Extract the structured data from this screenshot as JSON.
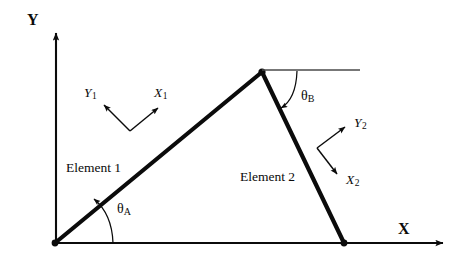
{
  "figure": {
    "background_color": "#ffffff",
    "ink_color": "#0b0b0b",
    "width": 455,
    "height": 261
  },
  "global_axes": {
    "x_label": "X",
    "y_label": "Y",
    "origin": {
      "x": 55,
      "y": 243
    },
    "x_axis_end": {
      "x": 450,
      "y": 243
    },
    "y_axis_end": {
      "x": 56,
      "y": 26
    }
  },
  "nodes": [
    {
      "name": "origin-node",
      "x": 55,
      "y": 243
    },
    {
      "name": "apex-node",
      "x": 262,
      "y": 72
    },
    {
      "name": "base-right-node",
      "x": 344,
      "y": 243
    }
  ],
  "elements": [
    {
      "label": "Element 1",
      "from": {
        "x": 55,
        "y": 243
      },
      "to": {
        "x": 262,
        "y": 72
      },
      "label_position": {
        "x": 66,
        "y": 162
      }
    },
    {
      "label": "Element 2",
      "from": {
        "x": 262,
        "y": 72
      },
      "to": {
        "x": 344,
        "y": 243
      },
      "label_position": {
        "x": 240,
        "y": 170
      }
    }
  ],
  "local_frames": [
    {
      "element": "Element 1",
      "x_axis_label": "X",
      "x_axis_subscript": "1",
      "y_axis_label": "Y",
      "y_axis_subscript": "1",
      "corner": {
        "x": 130,
        "y": 131
      },
      "x_tip": {
        "x": 162,
        "y": 104
      },
      "y_tip": {
        "x": 100,
        "y": 101
      },
      "x_label_position": {
        "x": 155,
        "y": 88
      },
      "y_label_position": {
        "x": 84,
        "y": 88
      }
    },
    {
      "element": "Element 2",
      "x_axis_label": "X",
      "x_axis_subscript": "2",
      "y_axis_label": "Y",
      "y_axis_subscript": "2",
      "corner": {
        "x": 317,
        "y": 148
      },
      "x_tip": {
        "x": 341,
        "y": 178
      },
      "y_tip": {
        "x": 349,
        "y": 124
      },
      "x_label_position": {
        "x": 348,
        "y": 175
      },
      "y_label_position": {
        "x": 356,
        "y": 118
      }
    }
  ],
  "angles": [
    {
      "name": "theta-a",
      "symbol": "θ",
      "subscript": "A",
      "description": "Inclination of Element 1 measured from the global X axis",
      "label_position": {
        "x": 117,
        "y": 204
      },
      "vertex": {
        "x": 55,
        "y": 243
      }
    },
    {
      "name": "theta-b",
      "symbol": "θ",
      "subscript": "B",
      "description": "Inclination of Element 2 measured from the horizontal reference line at the apex",
      "label_position": {
        "x": 301,
        "y": 91
      },
      "vertex": {
        "x": 262,
        "y": 72
      }
    }
  ],
  "reference_line": {
    "name": "apex-horizontal-reference",
    "from": {
      "x": 262,
      "y": 70
    },
    "to": {
      "x": 360,
      "y": 70
    }
  }
}
